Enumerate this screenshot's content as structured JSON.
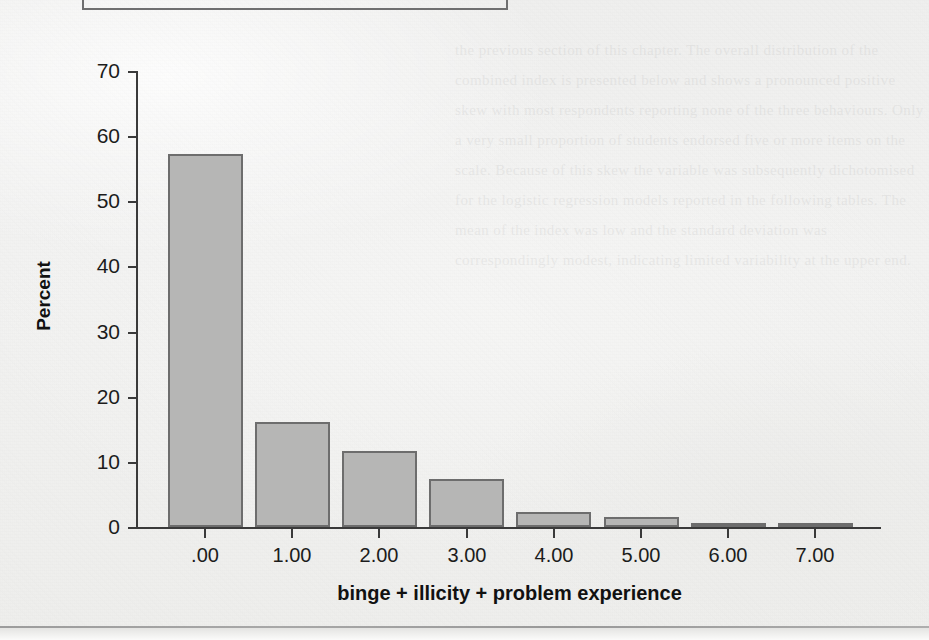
{
  "document": {
    "background_color": "#f1f1f0",
    "ghost_text": "the previous section of this chapter. The overall distribution of the combined index is presented below and shows a pronounced positive skew with most respondents reporting none of the three behaviours. Only a very small proportion of students endorsed five or more items on the scale. Because of this skew the variable was subsequently dichotomised for the logistic regression models reported in the following tables. The mean of the index was low and the standard deviation was correspondingly modest, indicating limited variability at the upper end."
  },
  "chart_data": {
    "type": "bar",
    "title": "",
    "xlabel": "binge + illicity + problem experience",
    "ylabel": "Percent",
    "categories": [
      ".00",
      "1.00",
      "2.00",
      "3.00",
      "4.00",
      "5.00",
      "6.00",
      "7.00"
    ],
    "values": [
      57.2,
      16.1,
      11.6,
      7.3,
      2.3,
      1.5,
      0.6,
      0.3
    ],
    "ylim": [
      0,
      70
    ],
    "ytick_labels": [
      "0",
      "10",
      "20",
      "30",
      "40",
      "50",
      "60",
      "70"
    ],
    "ytick_values": [
      0,
      10,
      20,
      30,
      40,
      50,
      60,
      70
    ],
    "grid": false,
    "legend": false,
    "bar_fill_color": "#b6b6b5",
    "bar_border_color": "#6d6d6d",
    "axis_color": "#3a3a3a"
  }
}
